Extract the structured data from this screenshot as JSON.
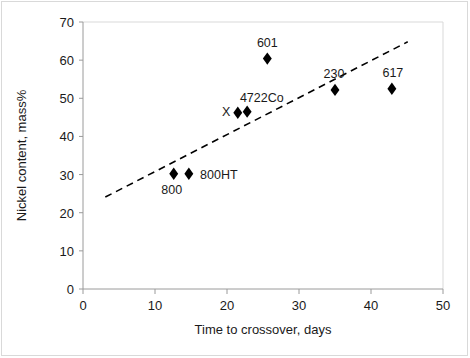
{
  "chart_data": {
    "type": "scatter",
    "title": "",
    "xlabel": "Time to crossover, days",
    "ylabel": "Nickel content, mass%",
    "xlim": [
      0,
      50
    ],
    "ylim": [
      0,
      70
    ],
    "xticks": [
      0,
      10,
      20,
      30,
      40,
      50
    ],
    "yticks": [
      0,
      10,
      20,
      30,
      40,
      50,
      60,
      70
    ],
    "xtick_labels": [
      "0",
      "10",
      "20",
      "30",
      "40",
      "50"
    ],
    "ytick_labels": [
      "0",
      "10",
      "20",
      "30",
      "40",
      "50",
      "60",
      "70"
    ],
    "grid": false,
    "legend": "none",
    "marker": "filled-diamond",
    "marker_color": "#000000",
    "points": [
      {
        "label": "800",
        "x": 12.6,
        "y": 30.2,
        "label_dx": -2,
        "label_dy": 20
      },
      {
        "label": "800HT",
        "x": 14.7,
        "y": 30.2,
        "label_dx": 30,
        "label_dy": 5
      },
      {
        "label": "X",
        "x": 19.9,
        "y": 46.3,
        "label_dx": 0,
        "label_dy": 4,
        "marker": "none"
      },
      {
        "label": "4722Co",
        "x": 21.5,
        "y": 46.2,
        "label_dx": 24,
        "label_dy": -11
      },
      {
        "label": "",
        "x": 22.8,
        "y": 46.5,
        "label_dx": 0,
        "label_dy": 0
      },
      {
        "label": "601",
        "x": 25.6,
        "y": 60.4,
        "label_dx": 0,
        "label_dy": -12
      },
      {
        "label": "230",
        "x": 35.0,
        "y": 52.2,
        "label_dx": -1,
        "label_dy": -12
      },
      {
        "label": "617",
        "x": 42.9,
        "y": 52.5,
        "label_dx": 1,
        "label_dy": -12
      }
    ],
    "trendline": {
      "style": "dashed",
      "color": "#000000",
      "x_start": 3.1,
      "y_start": 24.1,
      "x_end": 45.1,
      "y_end": 64.8
    }
  }
}
